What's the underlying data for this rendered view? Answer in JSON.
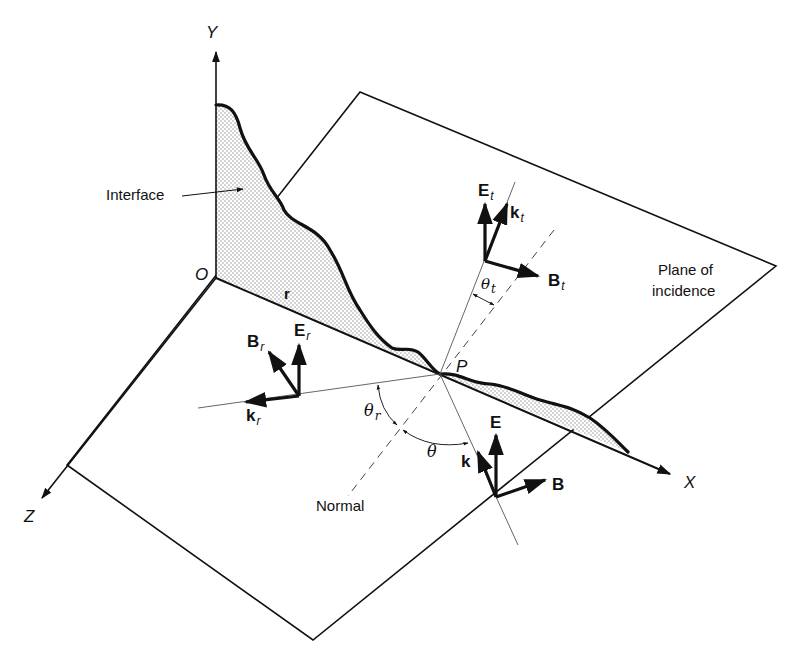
{
  "figure": {
    "colors": {
      "line": "#111111",
      "stipple": "#9a9a9a",
      "background": "#ffffff"
    }
  },
  "axes": {
    "y_label": "Y",
    "x_label": "X",
    "z_label": "Z",
    "origin_label": "O"
  },
  "labels": {
    "interface": "Interface",
    "plane": [
      "Plane of",
      "incidence"
    ],
    "normal": "Normal",
    "point": "P",
    "position_vector": "r"
  },
  "vectors": {
    "incident": {
      "k": "k",
      "E": "E",
      "B": "B"
    },
    "reflected": {
      "k": "k",
      "E": "E",
      "B": "B",
      "subscript": "r"
    },
    "transmitted": {
      "k": "k",
      "E": "E",
      "B": "B",
      "subscript": "t"
    }
  },
  "angles": {
    "incidence": "θ",
    "reflection": "θ",
    "reflection_sub": "r",
    "transmission": "θ",
    "transmission_sub": "t"
  }
}
